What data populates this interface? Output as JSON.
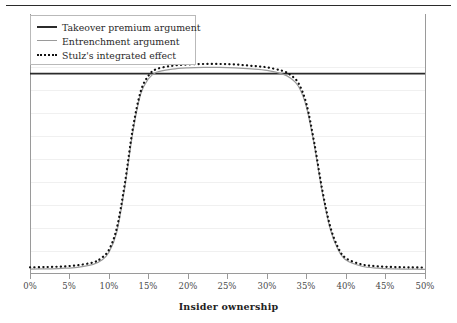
{
  "figure": {
    "top_rule": true
  },
  "legend": {
    "position": "top-left",
    "entries": [
      {
        "label": "Takeover premium argument",
        "marker": "thick-solid-line",
        "color": "#2b2b2b"
      },
      {
        "label": "Entrenchment argument",
        "marker": "thin-solid-line",
        "color": "#9a9a9a"
      },
      {
        "label": "Stulz's integrated effect",
        "marker": "dotted-line",
        "color": "#111111"
      }
    ]
  },
  "chart_data": {
    "type": "line",
    "title": "",
    "subtitle": "",
    "xlabel": "Insider ownership",
    "ylabel": "",
    "xlim": [
      0,
      50
    ],
    "ylim": [
      0,
      1
    ],
    "grid": true,
    "y_tick_labels": [],
    "x_tick_labels": [
      "0%",
      "5%",
      "10%",
      "15%",
      "20%",
      "25%",
      "30%",
      "35%",
      "40%",
      "45%",
      "50%"
    ],
    "x_ticks": [
      0,
      5,
      10,
      15,
      20,
      25,
      30,
      35,
      40,
      45,
      50
    ],
    "legend_position": "upper left",
    "series": [
      {
        "name": "Takeover premium argument",
        "style": "solid",
        "color": "#2b2b2b",
        "width": 1.8,
        "x": [
          0,
          50
        ],
        "values": [
          0.77,
          0.77
        ]
      },
      {
        "name": "Entrenchment argument",
        "style": "solid",
        "color": "#9a9a9a",
        "width": 1.2,
        "x": [
          0,
          2,
          4,
          6,
          8,
          9,
          10,
          11,
          12,
          13,
          14,
          15,
          16,
          18,
          20,
          22,
          24,
          26,
          28,
          30,
          32,
          33,
          34,
          35,
          36,
          37,
          38,
          39,
          40,
          42,
          44,
          46,
          48,
          50
        ],
        "values": [
          0.015,
          0.016,
          0.018,
          0.022,
          0.033,
          0.048,
          0.08,
          0.16,
          0.33,
          0.54,
          0.69,
          0.75,
          0.775,
          0.787,
          0.792,
          0.794,
          0.794,
          0.792,
          0.788,
          0.782,
          0.768,
          0.752,
          0.72,
          0.64,
          0.49,
          0.31,
          0.17,
          0.09,
          0.05,
          0.026,
          0.019,
          0.016,
          0.015,
          0.014
        ]
      },
      {
        "name": "Stulz's integrated effect",
        "style": "dotted",
        "color": "#111111",
        "width": 2.2,
        "x": [
          0,
          2,
          4,
          6,
          8,
          9,
          10,
          11,
          12,
          13,
          14,
          15,
          16,
          18,
          20,
          22,
          24,
          26,
          28,
          30,
          32,
          33,
          34,
          35,
          36,
          37,
          38,
          39,
          40,
          42,
          44,
          46,
          48,
          50
        ],
        "values": [
          0.022,
          0.023,
          0.025,
          0.03,
          0.041,
          0.057,
          0.09,
          0.175,
          0.345,
          0.555,
          0.7,
          0.762,
          0.787,
          0.8,
          0.805,
          0.807,
          0.807,
          0.805,
          0.8,
          0.794,
          0.78,
          0.764,
          0.732,
          0.652,
          0.5,
          0.32,
          0.18,
          0.098,
          0.057,
          0.033,
          0.026,
          0.023,
          0.022,
          0.021
        ]
      }
    ]
  },
  "axes": {
    "gridline_count": 8,
    "frame_color": "#9a9a9a"
  }
}
